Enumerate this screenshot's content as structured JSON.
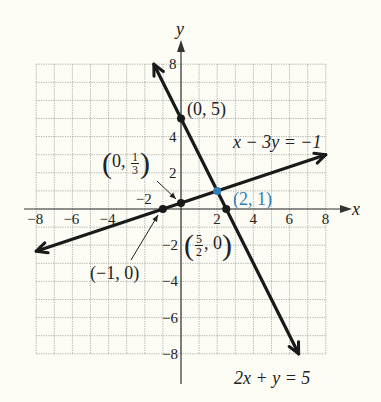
{
  "chart_data": {
    "type": "line",
    "title": "",
    "xlabel": "x",
    "ylabel": "y",
    "xlim": [
      -8,
      8
    ],
    "ylim": [
      -8,
      8
    ],
    "grid": true,
    "x_ticks": [
      "-8",
      "-6",
      "-4",
      "-2",
      "2",
      "4",
      "6",
      "8"
    ],
    "y_ticks": [
      "8",
      "4",
      "2",
      "-2",
      "-4",
      "-6",
      "-8"
    ],
    "series": [
      {
        "name": "2x + y = 5",
        "equation": "2x + y = 5",
        "points": [
          [
            -1.5,
            8
          ],
          [
            0,
            5
          ],
          [
            2.5,
            0
          ],
          [
            6.5,
            -8
          ]
        ],
        "color": "#1a1a1a"
      },
      {
        "name": "x - 3y = -1",
        "equation": "x − 3y = −1",
        "points": [
          [
            -8,
            -2.33
          ],
          [
            -1,
            0
          ],
          [
            0,
            0.333
          ],
          [
            8,
            3
          ]
        ],
        "color": "#1a1a1a"
      }
    ],
    "annotations": [
      {
        "label": "(0, 5)",
        "x": 0,
        "y": 5
      },
      {
        "label": "(0, 1/3)",
        "x": 0,
        "y": 0.333
      },
      {
        "label": "(−1, 0)",
        "x": -1,
        "y": 0
      },
      {
        "label": "(5/2, 0)",
        "x": 2.5,
        "y": 0
      },
      {
        "label": "(2, 1)",
        "x": 2,
        "y": 1,
        "color": "#2f7fb3",
        "note": "intersection"
      }
    ]
  },
  "labels": {
    "x_axis": "x",
    "y_axis": "y",
    "eq1": "x − 3y = −1",
    "eq2": "2x + y = 5",
    "pt_05": "(0, 5)",
    "pt_21": "(2, 1)",
    "pt_m10": "(−1, 0)",
    "pt_0third_pre": "0,",
    "pt_0third_num": "1",
    "pt_0third_den": "3",
    "pt_5half_num": "5",
    "pt_5half_den": "2",
    "pt_5half_post": ", 0",
    "lparen": "(",
    "rparen": ")"
  },
  "ticks": {
    "x": [
      {
        "v": -8,
        "t": "−8"
      },
      {
        "v": -6,
        "t": "−6"
      },
      {
        "v": -4,
        "t": "−4"
      },
      {
        "v": -2,
        "t": "−2"
      },
      {
        "v": 2,
        "t": "2"
      },
      {
        "v": 4,
        "t": "4"
      },
      {
        "v": 6,
        "t": "6"
      },
      {
        "v": 8,
        "t": "8"
      }
    ],
    "y": [
      {
        "v": 8,
        "t": "8"
      },
      {
        "v": 4,
        "t": "4"
      },
      {
        "v": 2,
        "t": "2"
      },
      {
        "v": -2,
        "t": "−2"
      },
      {
        "v": -4,
        "t": "−4"
      },
      {
        "v": -6,
        "t": "−6"
      },
      {
        "v": -8,
        "t": "−8"
      }
    ]
  },
  "colors": {
    "background": "#fdfdf6",
    "line": "#1a1a1a",
    "grid": "#9a9a9a",
    "highlight": "#2f7fb3"
  }
}
